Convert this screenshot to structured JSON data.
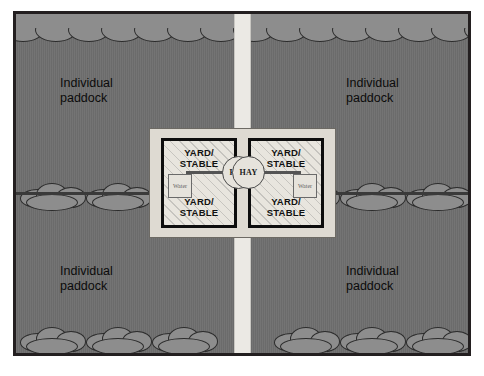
{
  "figure": {
    "background_color": "#ffffff",
    "border_color": "#231f20"
  },
  "site": {
    "ground_color": "#6f6f6f",
    "laneway": {
      "name": "central laneway",
      "color": "#ebe9e4"
    },
    "hedge_color": "#8d8d8d",
    "fence_color": "#3a3a3a"
  },
  "paddocks": [
    {
      "id": "top-left",
      "label": "Individual\npaddock"
    },
    {
      "id": "top-right",
      "label": "Individual\npaddock"
    },
    {
      "id": "bottom-left",
      "label": "Individual\npaddock"
    },
    {
      "id": "bottom-right",
      "label": "Individual\npaddock"
    }
  ],
  "stable_complex": {
    "outer_fill": "#dedad2",
    "blocks": [
      {
        "id": "left",
        "label_top": "YARD/\nSTABLE",
        "label_bottom": "YARD/\nSTABLE",
        "water_label": "Water",
        "hay_label": "HAY"
      },
      {
        "id": "right",
        "label_top": "YARD/\nSTABLE",
        "label_bottom": "YARD/\nSTABLE",
        "water_label": "Water",
        "hay_label": "HAY"
      }
    ]
  }
}
